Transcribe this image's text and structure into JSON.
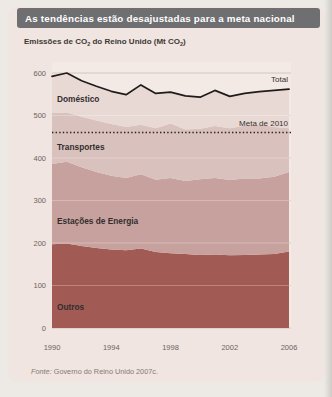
{
  "page": {
    "title": "As tendências estão desajustadas para a meta nacional",
    "subtitle": {
      "pre": "Emissões de CO",
      "sub1": "2",
      "mid": " do Reino Unido (Mt CO",
      "sub2": "2",
      "post": ")"
    },
    "source": {
      "label": "Fonte:",
      "text": " Governo do Reino Unido 2007c."
    }
  },
  "labels": {
    "domestico": "Doméstico",
    "transportes": "Transportes",
    "energia": "Estações de Energia",
    "outros": "Outros",
    "total": "Total",
    "meta": "Meta de 2010"
  },
  "chart_data": {
    "type": "area",
    "stacked": true,
    "title": "Emissões de CO2 do Reino Unido (Mt CO2)",
    "unit": "Mt CO2",
    "x": [
      1990,
      1991,
      1992,
      1993,
      1994,
      1995,
      1996,
      1997,
      1998,
      1999,
      2000,
      2001,
      2002,
      2003,
      2004,
      2005,
      2006
    ],
    "series": [
      {
        "name": "Outros",
        "color": "#a15a54",
        "values": [
          197,
          199,
          193,
          188,
          185,
          183,
          187,
          179,
          176,
          174,
          172,
          173,
          171,
          172,
          173,
          174,
          180
        ]
      },
      {
        "name": "Estações de Energia",
        "color": "#c7a19d",
        "values": [
          189,
          192,
          185,
          179,
          173,
          170,
          175,
          170,
          177,
          172,
          178,
          180,
          177,
          180,
          179,
          182,
          187
        ]
      },
      {
        "name": "Transportes",
        "color": "#d9c1bd",
        "values": [
          120,
          116,
          119,
          121,
          122,
          120,
          116,
          121,
          128,
          121,
          119,
          122,
          122,
          124,
          127,
          117,
          103
        ]
      },
      {
        "name": "Doméstico",
        "color": "#e9d9d5",
        "values": [
          86,
          93,
          85,
          81,
          77,
          76,
          94,
          82,
          74,
          79,
          74,
          84,
          75,
          76,
          77,
          86,
          92
        ]
      }
    ],
    "total_line": {
      "name": "Total",
      "color": "#201c1c",
      "values": [
        592,
        600,
        582,
        569,
        557,
        549,
        572,
        552,
        555,
        546,
        543,
        559,
        545,
        552,
        556,
        559,
        562
      ]
    },
    "target_line": {
      "name": "Meta de 2010",
      "value": 460,
      "color": "#262122",
      "style": "dotted"
    },
    "ylim": [
      0,
      600
    ],
    "yticks": [
      0,
      100,
      200,
      300,
      400,
      500,
      600
    ],
    "xticks": [
      1990,
      1994,
      1998,
      2002,
      2006
    ],
    "grid": true,
    "legend_position": "inline-labels"
  }
}
